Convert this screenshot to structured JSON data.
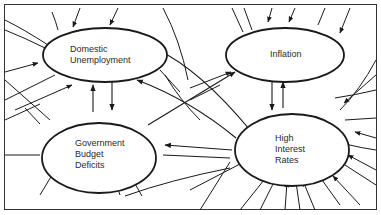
{
  "diagram": {
    "type": "causal-loop",
    "colors": {
      "ink": "#1a1a1a",
      "background": "#ffffff"
    },
    "nodes": [
      {
        "id": "domestic_unemployment",
        "label_lines": [
          "Domestic",
          "Unemployment"
        ]
      },
      {
        "id": "inflation",
        "label_lines": [
          "Inflation"
        ]
      },
      {
        "id": "government_budget_deficits",
        "label_lines": [
          "Government",
          "Budget",
          "Deficits"
        ]
      },
      {
        "id": "high_interest_rates",
        "label_lines": [
          "High",
          "Interest",
          "Rates"
        ]
      }
    ],
    "edges": [
      {
        "from": "domestic_unemployment",
        "to": "government_budget_deficits"
      },
      {
        "from": "government_budget_deficits",
        "to": "domestic_unemployment"
      },
      {
        "from": "inflation",
        "to": "high_interest_rates"
      },
      {
        "from": "high_interest_rates",
        "to": "inflation"
      },
      {
        "from": "government_budget_deficits",
        "to": "inflation"
      },
      {
        "from": "high_interest_rates",
        "to": "government_budget_deficits"
      },
      {
        "from": "high_interest_rates",
        "to": "domestic_unemployment"
      }
    ]
  }
}
